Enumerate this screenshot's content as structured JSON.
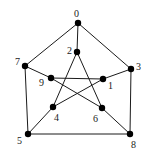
{
  "diagram": {
    "type": "graph",
    "name": "Petersen graph",
    "nodes": [
      {
        "id": "0",
        "label": "0",
        "x": 78,
        "y": 23,
        "lx": 74,
        "ly": 17
      },
      {
        "id": "1",
        "label": "1",
        "x": 103,
        "y": 79,
        "lx": 108,
        "ly": 89
      },
      {
        "id": "2",
        "label": "2",
        "x": 77,
        "y": 52,
        "lx": 67,
        "ly": 54
      },
      {
        "id": "3",
        "label": "3",
        "x": 131,
        "y": 69,
        "lx": 136,
        "ly": 70
      },
      {
        "id": "4",
        "label": "4",
        "x": 53,
        "y": 107,
        "lx": 54,
        "ly": 121
      },
      {
        "id": "5",
        "label": "5",
        "x": 28,
        "y": 134,
        "lx": 17,
        "ly": 144
      },
      {
        "id": "6",
        "label": "6",
        "x": 102,
        "y": 108,
        "lx": 93,
        "ly": 122
      },
      {
        "id": "7",
        "label": "7",
        "x": 25,
        "y": 66,
        "lx": 15,
        "ly": 65
      },
      {
        "id": "8",
        "label": "8",
        "x": 130,
        "y": 134,
        "lx": 131,
        "ly": 148
      },
      {
        "id": "9",
        "label": "9",
        "x": 51,
        "y": 78,
        "lx": 39,
        "ly": 86
      }
    ],
    "edges": [
      [
        "0",
        "3"
      ],
      [
        "3",
        "8"
      ],
      [
        "8",
        "5"
      ],
      [
        "5",
        "7"
      ],
      [
        "7",
        "0"
      ],
      [
        "0",
        "2"
      ],
      [
        "3",
        "1"
      ],
      [
        "8",
        "6"
      ],
      [
        "5",
        "4"
      ],
      [
        "7",
        "9"
      ],
      [
        "2",
        "4"
      ],
      [
        "2",
        "6"
      ],
      [
        "9",
        "1"
      ],
      [
        "9",
        "6"
      ],
      [
        "4",
        "1"
      ]
    ],
    "colors": {
      "edge": "#1a1a1a",
      "node": "#000000",
      "background": "#ffffff"
    }
  }
}
